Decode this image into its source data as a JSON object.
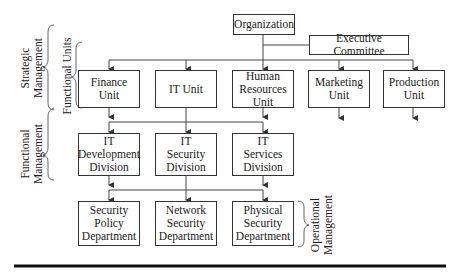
{
  "diagram": {
    "root": {
      "label": "Organization"
    },
    "executive": {
      "label": "Executive Committee"
    },
    "units": [
      {
        "label": "Finance\nUnit"
      },
      {
        "label": "IT Unit"
      },
      {
        "label": "Human\nResources\nUnit"
      },
      {
        "label": "Marketing\nUnit"
      },
      {
        "label": "Production\nUnit"
      }
    ],
    "divisions": [
      {
        "label": "IT\nDevelopment\nDivision"
      },
      {
        "label": "IT\nSecurity\nDivision"
      },
      {
        "label": "IT\nServices\nDivision"
      }
    ],
    "departments": [
      {
        "label": "Security\nPolicy\nDepartment"
      },
      {
        "label": "Network\nSecurity\nDepartment"
      },
      {
        "label": "Physical\nSecurity\nDepartment"
      }
    ],
    "brackets": {
      "strategic": "Strategic\nManagement",
      "functional_units": "Functional Units",
      "functional_management": "Functional\nManagement",
      "operational": "Operational\nManagement"
    },
    "colors": {
      "line": "#333333",
      "rule": "#111111",
      "background": "#ffffff"
    }
  }
}
